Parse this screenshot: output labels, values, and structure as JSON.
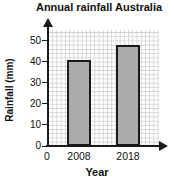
{
  "chart_data": {
    "type": "bar",
    "title": "Annual rainfall Australia",
    "categories": [
      "2008",
      "2018"
    ],
    "values": [
      41,
      48
    ],
    "xlabel": "Year",
    "ylabel": "Rainfall (mm)",
    "ylim": [
      0,
      55
    ],
    "yticks": [
      0,
      10,
      20,
      30,
      40,
      50
    ],
    "origin_label": "0",
    "grid": "on-fine-graph-paper",
    "legend": "none",
    "colors": {
      "bar_fill": "#ababab",
      "bar_border": "#1a1a1a",
      "axis": "#1a1a1a",
      "gridline": "#d2d2d2",
      "background": "#ffffff",
      "text": "#111111"
    }
  }
}
